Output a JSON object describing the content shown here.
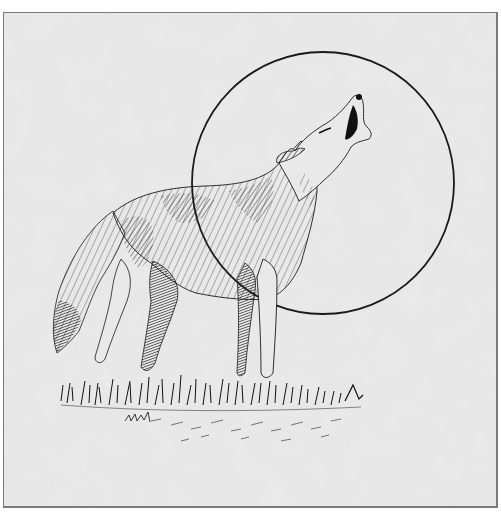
{
  "illustration": {
    "subject": "Howling coyote in front of the moon",
    "style": "pen-and-ink hatching on mottled gray paper",
    "colors": {
      "paper": "#e6e6e6",
      "paper_mottle": "#d6d6d6",
      "ink": "#1a1a1a",
      "frame_border": "#7a7a7a"
    },
    "moon": {
      "cx": 322,
      "cy": 182,
      "r": 131
    },
    "frame": {
      "x": 3,
      "y": 12,
      "width": 494,
      "height": 495
    }
  }
}
